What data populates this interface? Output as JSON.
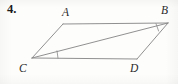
{
  "figure": {
    "problem_number": "4.",
    "shape": "parallelogram",
    "stroke_color": "#8a8a8a",
    "tick_color": "#8a8a8a",
    "label_color": "#2a2a2a",
    "background_color": "#fdfdfc",
    "vertices": [
      {
        "name": "A",
        "x": 63,
        "y": 24
      },
      {
        "name": "B",
        "x": 168,
        "y": 23
      },
      {
        "name": "C",
        "x": 32,
        "y": 58
      },
      {
        "name": "D",
        "x": 137,
        "y": 59
      }
    ],
    "labels": [
      {
        "name": "A",
        "text": "A"
      },
      {
        "name": "B",
        "text": "B"
      },
      {
        "name": "C",
        "text": "C"
      },
      {
        "name": "D",
        "text": "D"
      }
    ],
    "edges": [
      {
        "name": "AB",
        "from": "A",
        "to": "B"
      },
      {
        "name": "BD",
        "from": "B",
        "to": "D"
      },
      {
        "name": "DC",
        "from": "D",
        "to": "C"
      },
      {
        "name": "CA",
        "from": "C",
        "to": "A"
      }
    ],
    "diagonal": {
      "name": "CB",
      "from": "C",
      "to": "B"
    },
    "tick_marks": [
      {
        "name": "angle-B-tick",
        "at_vertex": "B",
        "x1": 156,
        "y1": 24,
        "x2": 159,
        "y2": 31
      },
      {
        "name": "angle-C-tick",
        "at_vertex": "C",
        "x1": 57,
        "y1": 51,
        "x2": 58,
        "y2": 58
      }
    ]
  }
}
